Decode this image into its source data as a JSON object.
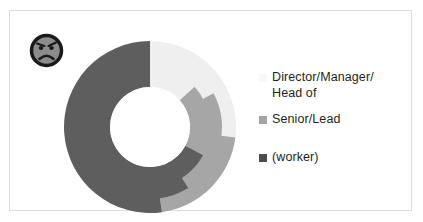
{
  "icon": {
    "name": "angry-face-icon",
    "face_fill": "#8c8c8c",
    "outline": "#1a1a1a"
  },
  "colors": {
    "level1": "#efefef",
    "level2": "#a6a6a6",
    "level3": "#5e5e5e",
    "background": "#ffffff",
    "text": "#231f20",
    "border": "#dcdcdc"
  },
  "legend": {
    "position": "right",
    "items": [
      {
        "label": "Director/Manager/\nHead of",
        "color": "#efefef",
        "swatch_visible": false
      },
      {
        "label": "Senior/Lead",
        "color": "#a6a6a6",
        "swatch_visible": true
      },
      {
        "label": "(worker)",
        "color": "#5e5e5e",
        "swatch_visible": true
      }
    ]
  },
  "chart_data": {
    "type": "pie",
    "variant": "nested-donut",
    "title": "",
    "subtitle": "",
    "xlabel": "",
    "ylabel": "",
    "grid": false,
    "legend_position": "right",
    "start_angle_deg": 0,
    "direction": "clockwise",
    "categories": [
      "Director/Manager/Head of",
      "Senior/Lead",
      "(worker)"
    ],
    "values": [
      25,
      25,
      50
    ],
    "units": "percent",
    "colors": [
      "#efefef",
      "#a6a6a6",
      "#5e5e5e"
    ],
    "rings": [
      {
        "name": "outer",
        "inner_radius": 56,
        "outer_radius": 86,
        "segments": [
          {
            "category": "Director/Manager/Head of",
            "color": "#efefef",
            "start_deg": 0,
            "end_deg": 97
          },
          {
            "category": "Senior/Lead",
            "color": "#a6a6a6",
            "start_deg": 97,
            "end_deg": 172
          },
          {
            "category": "(worker)",
            "color": "#5e5e5e",
            "start_deg": 172,
            "end_deg": 360
          }
        ]
      },
      {
        "name": "middle",
        "inner_radius": 44,
        "outer_radius": 72,
        "segments": [
          {
            "category": "Director/Manager/Head of",
            "color": "#efefef",
            "start_deg": 0,
            "end_deg": 62
          },
          {
            "category": "Senior/Lead",
            "color": "#a6a6a6",
            "start_deg": 62,
            "end_deg": 148
          },
          {
            "category": "(worker)",
            "color": "#5e5e5e",
            "start_deg": 148,
            "end_deg": 360
          }
        ]
      },
      {
        "name": "inner",
        "inner_radius": 40,
        "outer_radius": 60,
        "segments": [
          {
            "category": "Director/Manager/Head of",
            "color": "#efefef",
            "start_deg": 0,
            "end_deg": 48
          },
          {
            "category": "Senior/Lead",
            "color": "#a6a6a6",
            "start_deg": 48,
            "end_deg": 118
          },
          {
            "category": "(worker)",
            "color": "#5e5e5e",
            "start_deg": 118,
            "end_deg": 360
          }
        ]
      }
    ]
  }
}
